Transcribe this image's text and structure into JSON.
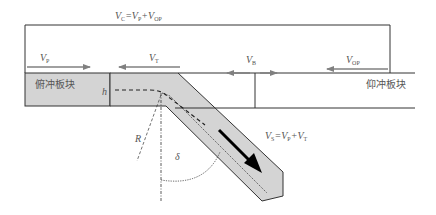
{
  "diagram": {
    "title_equation": {
      "main": "V",
      "sub1": "C",
      "eq": "=V",
      "sub2": "P",
      "plus": "+V",
      "sub3": "OP"
    },
    "labels": {
      "vp": {
        "main": "V",
        "sub": "P"
      },
      "vt": {
        "main": "V",
        "sub": "T"
      },
      "vb": {
        "main": "V",
        "sub": "B"
      },
      "vop": {
        "main": "V",
        "sub": "OP"
      },
      "vs": {
        "main": "V",
        "sub1": "S",
        "eq": "=V",
        "sub2": "P",
        "plus": "+V",
        "sub3": "T"
      },
      "h": "h",
      "R": "R",
      "delta": "δ"
    },
    "plates": {
      "subducting": "俯冲板块",
      "overriding": "仰冲板块"
    },
    "colors": {
      "plate_fill": "#d4d4d4",
      "line": "#333333",
      "arrow_gray": "#808080",
      "arrow_black": "#000000"
    }
  }
}
